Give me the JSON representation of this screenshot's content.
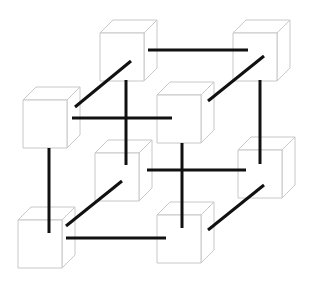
{
  "diagram": {
    "type": "cube-of-cubes",
    "description": "Eight cubes arranged at the corners of a larger cube, connected by twelve black edges",
    "colors": {
      "background": "#ffffff",
      "cube_outline": "#c8c8c8",
      "link": "#111111"
    },
    "cube_size": {
      "w": 44,
      "h": 48,
      "depth_dx": 13,
      "depth_dy": -13
    },
    "nodes": [
      {
        "id": "top-back-left",
        "x": 100,
        "y": 33
      },
      {
        "id": "top-back-right",
        "x": 233,
        "y": 33
      },
      {
        "id": "top-front-left",
        "x": 23,
        "y": 100
      },
      {
        "id": "top-front-right",
        "x": 157,
        "y": 95
      },
      {
        "id": "bottom-back-left",
        "x": 95,
        "y": 153
      },
      {
        "id": "bottom-back-right",
        "x": 238,
        "y": 150
      },
      {
        "id": "bottom-front-left",
        "x": 18,
        "y": 220
      },
      {
        "id": "bottom-front-right",
        "x": 157,
        "y": 215
      }
    ],
    "edges": [
      {
        "from": "top-back-left",
        "to": "top-back-right",
        "x1": 148,
        "y1": 50,
        "x2": 248,
        "y2": 50
      },
      {
        "from": "top-back-left",
        "to": "top-front-left",
        "x1": 131,
        "y1": 61,
        "x2": 75,
        "y2": 107
      },
      {
        "from": "top-back-left",
        "to": "bottom-back-left",
        "x1": 126,
        "y1": 80,
        "x2": 126,
        "y2": 165
      },
      {
        "from": "top-front-left",
        "to": "top-front-right",
        "x1": 72,
        "y1": 118,
        "x2": 172,
        "y2": 118
      },
      {
        "from": "top-back-right",
        "to": "top-front-right",
        "x1": 264,
        "y1": 56,
        "x2": 208,
        "y2": 101
      },
      {
        "from": "top-back-right",
        "to": "bottom-back-right",
        "x1": 260,
        "y1": 80,
        "x2": 260,
        "y2": 164
      },
      {
        "from": "top-front-left",
        "to": "bottom-front-left",
        "x1": 49,
        "y1": 148,
        "x2": 49,
        "y2": 233
      },
      {
        "from": "top-front-right",
        "to": "bottom-front-right",
        "x1": 182,
        "y1": 143,
        "x2": 182,
        "y2": 228
      },
      {
        "from": "bottom-back-left",
        "to": "bottom-back-right",
        "x1": 147,
        "y1": 170,
        "x2": 246,
        "y2": 170
      },
      {
        "from": "bottom-back-left",
        "to": "bottom-front-left",
        "x1": 122,
        "y1": 181,
        "x2": 66,
        "y2": 226
      },
      {
        "from": "bottom-back-right",
        "to": "bottom-front-right",
        "x1": 264,
        "y1": 185,
        "x2": 208,
        "y2": 230
      },
      {
        "from": "bottom-front-left",
        "to": "bottom-front-right",
        "x1": 66,
        "y1": 238,
        "x2": 166,
        "y2": 238
      }
    ]
  }
}
